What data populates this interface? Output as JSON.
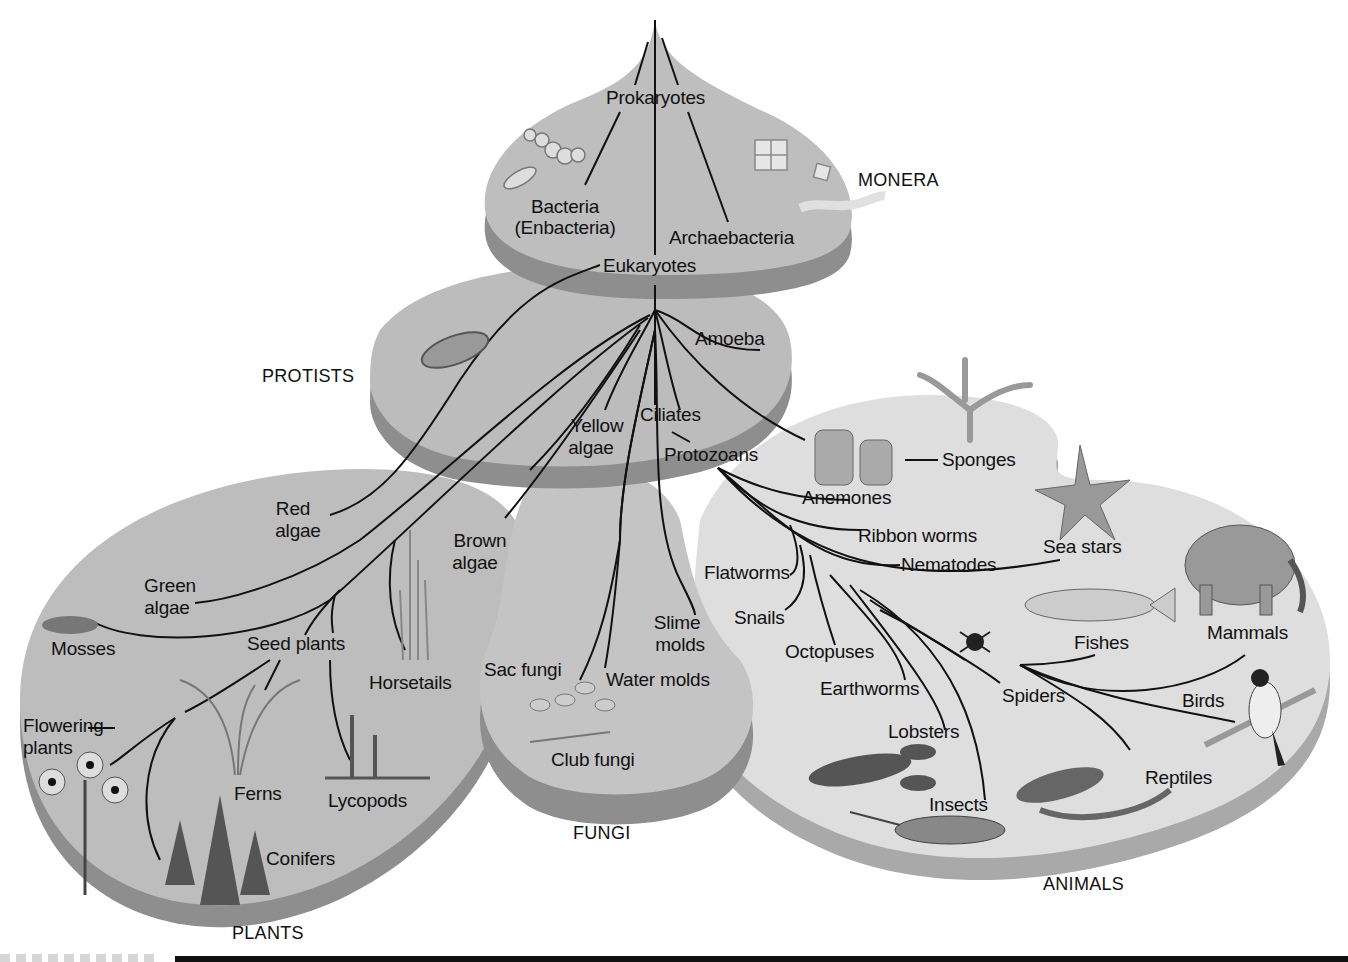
{
  "figure": {
    "colors": {
      "platform_top": "#b9b9b9",
      "platform_side": "#8c8c8c",
      "animals_top": "#dcdcdc",
      "animals_side": "#a9a9a9",
      "line": "#111111",
      "background": "#ffffff"
    }
  },
  "kingdoms": {
    "monera": "MONERA",
    "protists": "PROTISTS",
    "plants": "PLANTS",
    "fungi": "FUNGI",
    "animals": "ANIMALS"
  },
  "nodes": {
    "prokaryotes": "Prokaryotes",
    "bacteria_line1": "Bacteria",
    "bacteria_line2": "(Enbacteria)",
    "archaebacteria": "Archaebacteria",
    "eukaryotes": "Eukaryotes",
    "amoeba": "Amoeba",
    "yellow_algae_line1": "Yellow",
    "yellow_algae_line2": "algae",
    "ciliates": "Ciliates",
    "protozoans": "Protozoans",
    "red_algae_line1": "Red",
    "red_algae_line2": "algae",
    "brown_algae_line1": "Brown",
    "brown_algae_line2": "algae",
    "green_algae_line1": "Green",
    "green_algae_line2": "algae",
    "mosses": "Mosses",
    "seed_plants": "Seed plants",
    "horsetails": "Horsetails",
    "flowering_plants_line1": "Flowering",
    "flowering_plants_line2": "plants",
    "ferns": "Ferns",
    "lycopods": "Lycopods",
    "conifers": "Conifers",
    "sac_fungi": "Sac fungi",
    "slime_molds_line1": "Slime",
    "slime_molds_line2": "molds",
    "water_molds": "Water molds",
    "club_fungi": "Club fungi",
    "anemones": "Anemones",
    "sponges": "Sponges",
    "ribbon_worms": "Ribbon worms",
    "nematodes": "Nematodes",
    "flatworms": "Flatworms",
    "sea_stars": "Sea stars",
    "snails": "Snails",
    "octopuses": "Octopuses",
    "earthworms": "Earthworms",
    "fishes": "Fishes",
    "mammals": "Mammals",
    "spiders": "Spiders",
    "birds": "Birds",
    "lobsters": "Lobsters",
    "reptiles": "Reptiles",
    "insects": "Insects"
  },
  "illustrations": [
    "bacteria-icon",
    "archaebacteria-icon",
    "paramecium-icon",
    "moss-icon",
    "horsetail-icon",
    "fern-icon",
    "lycopod-icon",
    "flower-icon",
    "conifer-icon",
    "mushroom-icon",
    "anemone-icon",
    "sponge-icon",
    "sea-star-icon",
    "elephant-icon",
    "fish-icon",
    "spider-icon",
    "bird-icon",
    "lobster-icon",
    "lizard-icon",
    "grasshopper-icon"
  ]
}
